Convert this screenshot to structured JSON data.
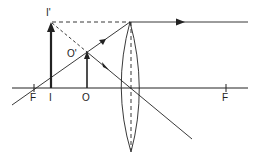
{
  "diagram": {
    "type": "optics-ray-diagram",
    "colors": {
      "line": "#222222",
      "background": "#ffffff"
    },
    "labels": {
      "focal_left": "F",
      "focal_right": "F",
      "object_base": "O",
      "object_tip": "O'",
      "image_base": "I",
      "image_tip": "I'"
    },
    "elements": {
      "optical_axis": {
        "y": 88,
        "x1": 12,
        "x2": 248
      },
      "lens": {
        "x": 130,
        "top": 22,
        "bottom": 152
      },
      "focal_left_x": 34,
      "focal_right_x": 226,
      "object": {
        "x": 87,
        "tip_y": 52
      },
      "image": {
        "x": 51,
        "tip_y": 23
      }
    }
  }
}
